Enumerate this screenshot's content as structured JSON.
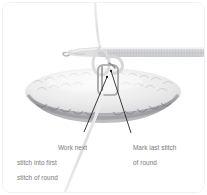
{
  "figure": {
    "kind": "crochet-instruction-photo",
    "background_color": "#ffffff",
    "border_color": "#f1f1f1",
    "corner_radius_px": 9
  },
  "subject": {
    "hook": {
      "name": "crochet-hook",
      "color": "#d8d9db",
      "shaft_shading": "#c6c7ca",
      "orientation": "horizontal",
      "tip_side": "left"
    },
    "fabric": {
      "name": "crochet-fabric-oval",
      "highlight_color": "#f2f2f3",
      "midtone_color": "#d9d9db",
      "shadow_color": "#a3a4a8",
      "shape": "oval"
    },
    "marker": {
      "name": "stitch-marker",
      "color": "#8c8d91",
      "shape": "rounded-rectangle-ring"
    },
    "yarn": {
      "name": "yarn-strand",
      "color": "#e6e6e7"
    }
  },
  "annotations": {
    "left": {
      "id": "callout-work-next-stitch",
      "line1": "Work next",
      "line2": "stitch into first",
      "line3": "stitch of round",
      "text_color": "#77787b",
      "leader_color": "#1c1c1c",
      "leader": {
        "x1": 81,
        "y1": 129,
        "x2": 104,
        "y2": 74
      }
    },
    "right": {
      "id": "callout-mark-last-stitch",
      "line1": "Mark last stitch",
      "line2": "of round",
      "text_color": "#77787b",
      "leader_color": "#1c1c1c",
      "leader": {
        "x1": 128,
        "y1": 130,
        "x2": 108,
        "y2": 68
      }
    }
  }
}
